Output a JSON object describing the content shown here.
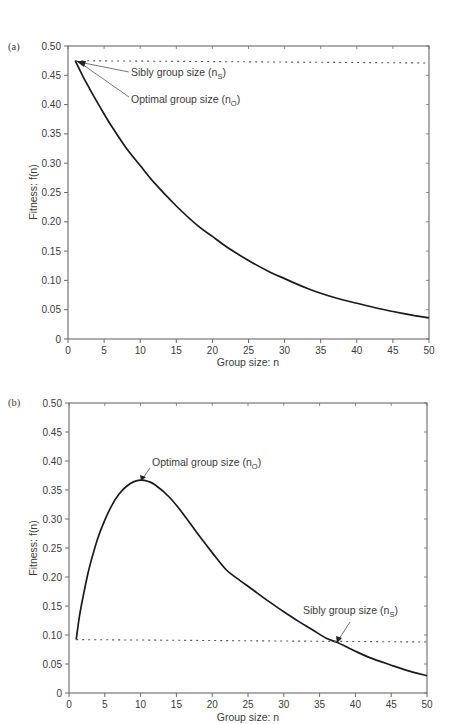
{
  "chart_data": [
    {
      "panel": "(a)",
      "type": "line",
      "xlabel": "Group size: n",
      "ylabel": "Fitness: f(n)",
      "xlim": [
        0,
        50
      ],
      "ylim": [
        0,
        0.5
      ],
      "xticks": [
        0,
        5,
        10,
        15,
        20,
        25,
        30,
        35,
        40,
        45,
        50
      ],
      "yticks": [
        0,
        0.05,
        0.1,
        0.15,
        0.2,
        0.25,
        0.3,
        0.35,
        0.4,
        0.45,
        0.5
      ],
      "ytick_labels": [
        "0",
        "0.05",
        "0.10",
        "0.15",
        "0.20",
        "0.25",
        "0.30",
        "0.35",
        "0.40",
        "0.45",
        "0.50"
      ],
      "grid": false,
      "series": [
        {
          "name": "f(n)",
          "style": "solid",
          "x": [
            1,
            2,
            3,
            4,
            5,
            6,
            8,
            10,
            12,
            15,
            18,
            20,
            22,
            25,
            28,
            30,
            33,
            35,
            38,
            40,
            43,
            45,
            48,
            50
          ],
          "y": [
            0.475,
            0.45,
            0.427,
            0.405,
            0.384,
            0.364,
            0.327,
            0.296,
            0.266,
            0.227,
            0.193,
            0.175,
            0.157,
            0.134,
            0.114,
            0.103,
            0.087,
            0.078,
            0.067,
            0.061,
            0.052,
            0.047,
            0.04,
            0.036
          ]
        },
        {
          "name": "Sibly reference level",
          "style": "dotted",
          "x": [
            1,
            50
          ],
          "y": [
            0.475,
            0.471
          ]
        }
      ],
      "annotations": [
        {
          "text": "Sibly group size (n",
          "sub": "S",
          "suffix": ")",
          "point": [
            1,
            0.475
          ]
        },
        {
          "text": "Optimal group size (n",
          "sub": "O",
          "suffix": ")",
          "point": [
            1,
            0.475
          ]
        }
      ]
    },
    {
      "panel": "(b)",
      "type": "line",
      "xlabel": "Group size: n",
      "ylabel": "Fitness: f(n)",
      "xlim": [
        0,
        50
      ],
      "ylim": [
        0,
        0.5
      ],
      "xticks": [
        0,
        5,
        10,
        15,
        20,
        25,
        30,
        35,
        40,
        45,
        50
      ],
      "yticks": [
        0,
        0.05,
        0.1,
        0.15,
        0.2,
        0.25,
        0.3,
        0.35,
        0.4,
        0.45,
        0.5
      ],
      "ytick_labels": [
        "0",
        "0.05",
        "0.10",
        "0.15",
        "0.20",
        "0.25",
        "0.30",
        "0.35",
        "0.40",
        "0.45",
        "0.50"
      ],
      "grid": false,
      "series": [
        {
          "name": "f(n)",
          "style": "solid",
          "x": [
            1,
            1.5,
            2,
            2.5,
            3,
            4,
            5,
            6,
            7,
            8,
            9,
            10,
            11,
            12,
            14,
            16,
            18,
            20,
            22,
            24,
            26,
            28,
            30,
            32,
            34,
            36,
            37.5,
            40,
            42,
            45,
            48,
            50
          ],
          "y": [
            0.092,
            0.135,
            0.168,
            0.198,
            0.224,
            0.266,
            0.298,
            0.324,
            0.343,
            0.356,
            0.364,
            0.367,
            0.365,
            0.359,
            0.338,
            0.308,
            0.274,
            0.242,
            0.212,
            0.193,
            0.175,
            0.157,
            0.14,
            0.124,
            0.109,
            0.094,
            0.087,
            0.072,
            0.061,
            0.048,
            0.036,
            0.03
          ]
        },
        {
          "name": "Sibly reference level",
          "style": "dotted",
          "x": [
            1,
            50
          ],
          "y": [
            0.092,
            0.088
          ]
        }
      ],
      "annotations": [
        {
          "text": "Optimal group size (n",
          "sub": "O",
          "suffix": ")",
          "point": [
            10,
            0.367
          ]
        },
        {
          "text": "Sibly group size (n",
          "sub": "S",
          "suffix": ")",
          "point": [
            37.5,
            0.087
          ]
        }
      ]
    }
  ]
}
